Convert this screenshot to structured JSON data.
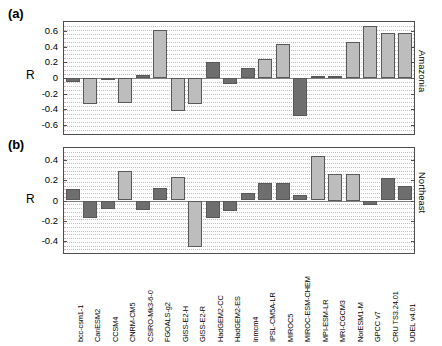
{
  "figure": {
    "panel_a_tag": "(a)",
    "panel_b_tag": "(b)",
    "ylabel_a": "R",
    "ylabel_b": "R",
    "region_a": "Amazonia",
    "region_b": "Northeast",
    "grid_color": "#d9a3a3",
    "bar_dark": "#6e6e6e",
    "bar_light": "#bdbdbd",
    "bar_edge": "#595959",
    "axis_color": "#4d4d4d"
  },
  "chart_data": [
    {
      "type": "bar",
      "title": "(a)",
      "xlabel": "",
      "ylabel": "R",
      "annotation": "Amazonia",
      "ylim": [
        -0.72,
        0.72
      ],
      "yticks": [
        -0.6,
        -0.4,
        -0.2,
        0,
        0.2,
        0.4,
        0.6
      ],
      "ytick_labels": [
        "-0.6",
        "-0.4",
        "-0.2",
        "0",
        "0.2",
        "0.4",
        "0.6"
      ],
      "grid": true,
      "legend": "none",
      "categories": [
        "bcc-csm1-1",
        "CanESM2",
        "CCSM4",
        "CNRM-CM5",
        "CSIRO-Mk3-6-0",
        "FGOALS-g2",
        "GISS-E2-H",
        "GISS-E2-R",
        "HadGEM2-CC",
        "HadGEM2-ES",
        "inmcm4",
        "IPSL-CM5A-LR",
        "MIROC5",
        "MIROC-ESM-CHEM",
        "MPI-ESM-LR",
        "MRI-CGCM3",
        "NorESM1-M",
        "GPCC v7",
        "CRU TS3.24.01",
        "UDEL v4.01"
      ],
      "values": [
        -0.05,
        -0.33,
        -0.02,
        -0.32,
        0.04,
        0.62,
        -0.42,
        -0.33,
        0.21,
        -0.08,
        0.13,
        0.25,
        0.44,
        -0.49,
        0.02,
        0.02,
        0.46,
        0.67,
        0.58,
        0.58
      ],
      "shades": [
        "dark",
        "light",
        "dark",
        "light",
        "dark",
        "light",
        "light",
        "light",
        "dark",
        "dark",
        "dark",
        "light",
        "light",
        "dark",
        "dark",
        "dark",
        "light",
        "light",
        "light",
        "light"
      ]
    },
    {
      "type": "bar",
      "title": "(b)",
      "xlabel": "",
      "ylabel": "R",
      "annotation": "Northeast",
      "ylim": [
        -0.52,
        0.52
      ],
      "yticks": [
        -0.4,
        -0.2,
        0,
        0.2,
        0.4
      ],
      "ytick_labels": [
        "-0.4",
        "-0.2",
        "0",
        "0.2",
        "0.4"
      ],
      "grid": true,
      "legend": "none",
      "categories": [
        "bcc-csm1-1",
        "CanESM2",
        "CCSM4",
        "CNRM-CM5",
        "CSIRO-Mk3-6-0",
        "FGOALS-g2",
        "GISS-E2-H",
        "GISS-E2-R",
        "HadGEM2-CC",
        "HadGEM2-ES",
        "inmcm4",
        "IPSL-CM5A-LR",
        "MIROC5",
        "MIROC-ESM-CHEM",
        "MPI-ESM-LR",
        "MRI-CGCM3",
        "NorESM1-M",
        "GPCC v7",
        "CRU TS3.24.01",
        "UDEL v4.01"
      ],
      "values": [
        0.11,
        -0.17,
        -0.08,
        0.29,
        -0.09,
        0.12,
        0.23,
        -0.46,
        -0.17,
        -0.1,
        0.07,
        0.17,
        0.17,
        0.05,
        0.44,
        0.26,
        0.26,
        -0.04,
        0.22,
        0.14
      ],
      "shades": [
        "dark",
        "dark",
        "dark",
        "light",
        "dark",
        "dark",
        "light",
        "light",
        "dark",
        "dark",
        "dark",
        "dark",
        "dark",
        "dark",
        "light",
        "light",
        "light",
        "dark",
        "dark",
        "dark"
      ]
    }
  ]
}
